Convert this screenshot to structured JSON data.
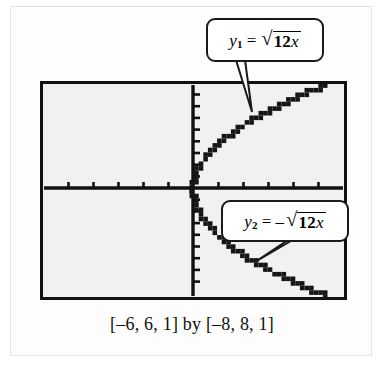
{
  "figure": {
    "caption": "[–6, 6, 1] by [–8, 8, 1]",
    "screen_bg_color": "#f1f1f1",
    "frame_color": "#111111",
    "curve_color": "#151515"
  },
  "callouts": [
    {
      "name": "callout-y1",
      "text": "y₁ = √(12x)",
      "var": "y",
      "subscript": "1",
      "equals": "=",
      "sign": "",
      "radical_sign": "√",
      "radicand_num": "12",
      "radicand_var": "x"
    },
    {
      "name": "callout-y2",
      "text": "y₂ = –√(12x)",
      "var": "y",
      "subscript": "2",
      "equals": "=",
      "sign": "–",
      "radical_sign": "√",
      "radicand_num": "12",
      "radicand_var": "x"
    }
  ],
  "chart_data": {
    "type": "line",
    "title": "",
    "subtitle": "",
    "xlabel": "",
    "ylabel": "",
    "xlim": [
      -6,
      6
    ],
    "ylim": [
      -8,
      8
    ],
    "xtick_step": 1,
    "ytick_step": 1,
    "grid": false,
    "legend": "callout-labels",
    "axes_style": "graphing-calculator",
    "annotations": [
      "y₁ = √(12x)",
      "y₂ = –√(12x)"
    ],
    "caption": "[–6, 6, 1] by [–8, 8, 1]",
    "series": [
      {
        "name": "y1 = sqrt(12x)",
        "style": "dotted-pixels",
        "equation": "y = sqrt(12*x)",
        "domain": [
          0,
          6
        ],
        "x": [
          0,
          0.1,
          0.2,
          0.3,
          0.4,
          0.6,
          0.8,
          1.0,
          1.3,
          1.6,
          2.0,
          2.4,
          2.9,
          3.4,
          4.0,
          4.6,
          5.2,
          5.9
        ],
        "y": [
          0.0,
          1.1,
          1.55,
          1.9,
          2.19,
          2.68,
          3.1,
          3.46,
          3.95,
          4.38,
          4.9,
          5.37,
          5.9,
          6.39,
          6.93,
          7.43,
          7.9,
          8.0
        ]
      },
      {
        "name": "y2 = -sqrt(12x)",
        "style": "dotted-pixels",
        "equation": "y = -sqrt(12*x)",
        "domain": [
          0,
          6
        ],
        "x": [
          0,
          0.1,
          0.2,
          0.3,
          0.4,
          0.6,
          0.8,
          1.0,
          1.3,
          1.6,
          2.0,
          2.4,
          2.9,
          3.4,
          4.0,
          4.6,
          5.2,
          5.9
        ],
        "y": [
          0.0,
          -1.1,
          -1.55,
          -1.9,
          -2.19,
          -2.68,
          -3.1,
          -3.46,
          -3.95,
          -4.38,
          -4.9,
          -5.37,
          -5.9,
          -6.39,
          -6.93,
          -7.43,
          -7.9,
          -8.0
        ]
      }
    ]
  }
}
